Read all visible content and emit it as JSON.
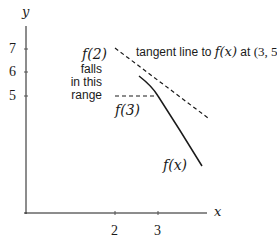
{
  "diagram": {
    "axes": {
      "x_label": "x",
      "y_label": "y",
      "x_ticks": [
        "2",
        "3"
      ],
      "y_ticks": [
        "7",
        "6",
        "5"
      ]
    },
    "annotations": {
      "tangent_label_prefix": "tangent line to ",
      "tangent_label_fx": "f(x)",
      "tangent_label_at": " at ",
      "tangent_label_point": "(3, 5)",
      "f2_label": "f(2)",
      "f2_note_line1": "falls",
      "f2_note_line2": "in this",
      "f2_note_line3": "range",
      "f3_label": "f(3)",
      "curve_label": "f(x)"
    },
    "colors": {
      "line": "#1a1a1a",
      "background": "#ffffff"
    }
  }
}
